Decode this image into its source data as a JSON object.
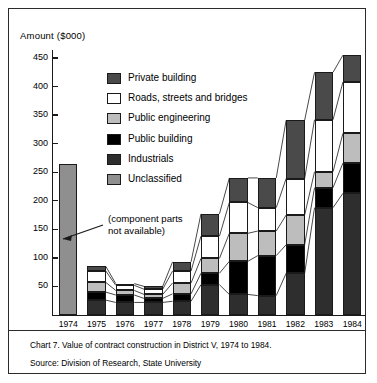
{
  "axis_title": "Amount ($000)",
  "annotation": {
    "line1": "(component parts",
    "line2": "not available)"
  },
  "caption": {
    "chart_line": "Chart 7. Value of contract construction in District V, 1974 to 1984.",
    "source_line": "Source: Division of Research, State University"
  },
  "legend": {
    "items": [
      {
        "label": "Private building",
        "key": "private",
        "color": "#4a4a4a"
      },
      {
        "label": "Roads, streets and bridges",
        "key": "roads",
        "color": "#ffffff"
      },
      {
        "label": "Public engineering",
        "key": "pubeng",
        "color": "#bdbdbd"
      },
      {
        "label": "Public building",
        "key": "pubbld",
        "color": "#000000"
      },
      {
        "label": "Industrials",
        "key": "indus",
        "color": "#2e2e2e"
      },
      {
        "label": "Unclassified",
        "key": "unclass",
        "color": "#8f8f8f"
      }
    ]
  },
  "chart_data": {
    "type": "bar",
    "subtype": "stacked-column",
    "title": "Chart 7. Value of contract construction in District V, 1974 to 1984.",
    "xlabel": "",
    "ylabel": "Amount ($000)",
    "ylim": [
      0,
      460
    ],
    "yticks": [
      50,
      100,
      150,
      200,
      250,
      300,
      350,
      400,
      450
    ],
    "ytick_labels": [
      "50",
      "100",
      "150",
      "200",
      "250",
      "300",
      "350",
      "400",
      "450"
    ],
    "grid": false,
    "legend_position": "inside-upper-left",
    "categories": [
      "1974",
      "1975",
      "1976",
      "1977",
      "1978",
      "1979",
      "1980",
      "1981",
      "1982",
      "1983",
      "1984"
    ],
    "stack_order_bottom_to_top": [
      "Industrials",
      "Public building",
      "Public engineering",
      "Roads, streets and bridges",
      "Private building"
    ],
    "series": [
      {
        "name": "Industrials",
        "values": [
          null,
          26,
          22,
          22,
          24,
          53,
          36,
          34,
          73,
          188,
          213
        ]
      },
      {
        "name": "Public building",
        "values": [
          null,
          14,
          13,
          7,
          13,
          20,
          58,
          70,
          50,
          35,
          53
        ]
      },
      {
        "name": "Public engineering",
        "values": [
          null,
          17,
          8,
          7,
          19,
          26,
          49,
          43,
          52,
          28,
          52
        ]
      },
      {
        "name": "Roads, streets and bridges",
        "values": [
          null,
          20,
          9,
          9,
          21,
          39,
          54,
          41,
          64,
          91,
          90
        ]
      },
      {
        "name": "Private building",
        "values": [
          null,
          8,
          3,
          5,
          16,
          39,
          43,
          52,
          102,
          83,
          47
        ]
      },
      {
        "name": "Unclassified",
        "values": [
          265,
          null,
          null,
          null,
          null,
          null,
          null,
          null,
          null,
          null,
          null
        ]
      }
    ],
    "totals": [
      265,
      85,
      55,
      50,
      93,
      177,
      240,
      240,
      341,
      425,
      455
    ],
    "annotations": [
      {
        "text": "(component parts not available)",
        "target_category": "1974"
      }
    ]
  }
}
